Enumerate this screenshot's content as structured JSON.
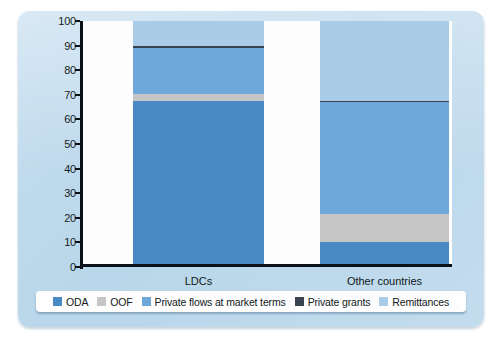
{
  "chart_data": {
    "type": "bar",
    "subtype": "stacked-100-percent",
    "title": "",
    "xlabel": "",
    "ylabel": "Share of total external finance %",
    "ylim": [
      0,
      100
    ],
    "yticks": [
      0,
      10,
      20,
      30,
      40,
      50,
      60,
      70,
      80,
      90,
      100
    ],
    "grid": false,
    "legend_position": "bottom",
    "categories": [
      "LDCs",
      "Other countries"
    ],
    "series": [
      {
        "name": "ODA",
        "color": "#4a8ac4",
        "values": [
          67.5,
          10.0
        ]
      },
      {
        "name": "OOF",
        "color": "#c6c6c6",
        "values": [
          3.0,
          11.5
        ]
      },
      {
        "name": "Private flows at market terms",
        "color": "#6ea7da",
        "values": [
          18.5,
          45.5
        ]
      },
      {
        "name": "Private grants",
        "color": "#3a4450",
        "values": [
          1.0,
          0.3
        ]
      },
      {
        "name": "Remittances",
        "color": "#a9cce8",
        "values": [
          10.0,
          32.7
        ]
      }
    ]
  },
  "axis": {
    "y_title": "Share of total external finance %",
    "tick_labels": [
      "100",
      "90",
      "80",
      "70",
      "60",
      "50",
      "40",
      "30",
      "20",
      "10",
      "0"
    ],
    "category_labels": [
      "LDCs",
      "Other countries"
    ]
  },
  "legend": {
    "items": [
      {
        "label": "ODA",
        "color": "#4a8ac4"
      },
      {
        "label": "OOF",
        "color": "#c6c6c6"
      },
      {
        "label": "Private flows at market terms",
        "color": "#6ea7da"
      },
      {
        "label": "Private grants",
        "color": "#3a4450"
      },
      {
        "label": "Remittances",
        "color": "#a9cce8"
      }
    ]
  },
  "colors": {
    "card_background": "#bfd8ec",
    "plot_background": "#fdfdfd",
    "axis": "#0b1118",
    "text": "#101820"
  }
}
